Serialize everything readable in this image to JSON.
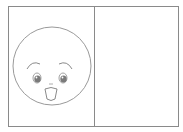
{
  "figure": {
    "panels": [
      {
        "id": "left",
        "content": "smiling-face"
      },
      {
        "id": "right",
        "content": "empty"
      }
    ],
    "colors": {
      "background": "#ffffff",
      "line": "#8a8a8a",
      "pupil": "#7a7a7a"
    }
  }
}
